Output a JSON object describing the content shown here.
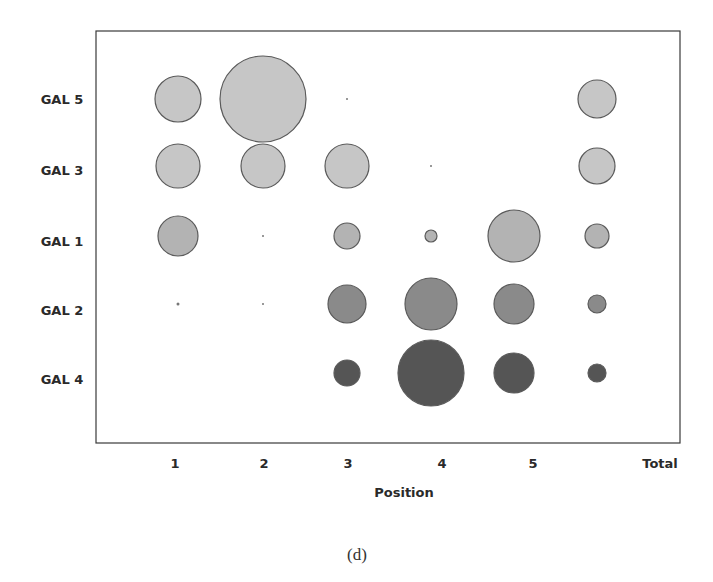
{
  "chart_data": {
    "type": "bubble",
    "title": "",
    "caption": "(d)",
    "xlabel": "Position",
    "ylabel": "",
    "categories": [
      "1",
      "2",
      "3",
      "4",
      "5",
      "Total"
    ],
    "rows": [
      "GAL 5",
      "GAL 3",
      "GAL 1",
      "GAL 2",
      "GAL 4"
    ],
    "grid": false,
    "legend": null,
    "series": [
      {
        "name": "GAL 5",
        "color": "#c6c6c6",
        "radius": [
          23,
          43,
          1,
          0,
          0,
          19
        ]
      },
      {
        "name": "GAL 3",
        "color": "#c6c6c6",
        "radius": [
          22,
          22,
          22,
          1,
          0,
          18
        ]
      },
      {
        "name": "GAL 1",
        "color": "#b3b3b3",
        "radius": [
          20,
          1,
          13,
          6,
          26,
          12
        ]
      },
      {
        "name": "GAL 2",
        "color": "#8a8a8a",
        "radius": [
          1.5,
          1,
          19,
          26,
          20,
          9
        ]
      },
      {
        "name": "GAL 4",
        "color": "#555555",
        "radius": [
          0,
          0,
          13,
          33,
          20,
          9
        ]
      }
    ],
    "relative_size_note": "values are bubble radii in px (relative magnitude)"
  },
  "layout": {
    "frame": {
      "x": 96,
      "y": 31,
      "w": 584,
      "h": 412
    },
    "col_x": [
      178,
      263,
      347,
      431,
      514,
      597
    ],
    "row_y": [
      99,
      166,
      236,
      304,
      373
    ],
    "ylabel_x": 62,
    "ylabel_y": [
      99,
      170,
      241,
      310,
      379
    ],
    "xlabel_y": 468,
    "xlabel_col_x": [
      175,
      264,
      348,
      442,
      533,
      660
    ],
    "axis_title": {
      "x": 404,
      "y": 497
    },
    "caption_pos": {
      "x": 357,
      "y": 560
    }
  }
}
